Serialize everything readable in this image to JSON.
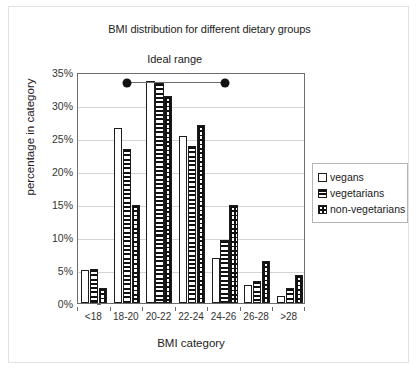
{
  "chart_data": {
    "type": "bar",
    "title": "BMI distribution for different dietary groups",
    "xlabel": "BMI category",
    "ylabel": "percentage in category",
    "categories": [
      "<18",
      "18-20",
      "20-22",
      "22-24",
      "24-26",
      "26-28",
      ">28"
    ],
    "series": [
      {
        "name": "vegans",
        "pattern": "plain",
        "values": [
          5.0,
          26.5,
          33.6,
          25.3,
          6.8,
          2.8,
          1.0
        ]
      },
      {
        "name": "vegetarians",
        "pattern": "hstripe",
        "values": [
          5.2,
          23.4,
          33.3,
          23.8,
          9.6,
          3.3,
          2.2
        ]
      },
      {
        "name": "non-vegetarians",
        "pattern": "dots",
        "values": [
          2.2,
          14.9,
          31.4,
          27.0,
          14.9,
          6.3,
          4.2
        ]
      }
    ],
    "ylim": [
      0,
      35
    ],
    "ytick_values": [
      0,
      5,
      10,
      15,
      20,
      25,
      30,
      35
    ],
    "ytick_labels": [
      "0%",
      "5%",
      "10%",
      "15%",
      "20%",
      "25%",
      "30%",
      "35%"
    ],
    "grid": true,
    "legend_position": "right",
    "annotations": [
      {
        "label": "Ideal range",
        "type": "range-bar",
        "y_value": 33.7,
        "x_start_category": "18-20",
        "x_end_category": "24-26",
        "marker": "filled-circle"
      }
    ],
    "colors": {
      "background": "#ffffff",
      "axis": "#6d6d6d",
      "grid": "#d4d4d4",
      "bar_edge": "#1c1c1c",
      "bar_fill": "#ffffff",
      "text": "#1a1a1a",
      "figure_border": "#e2e2e2"
    }
  },
  "legend": {
    "items": [
      {
        "label": "vegans"
      },
      {
        "label": "vegetarians"
      },
      {
        "label": "non-vegetarians"
      }
    ]
  }
}
